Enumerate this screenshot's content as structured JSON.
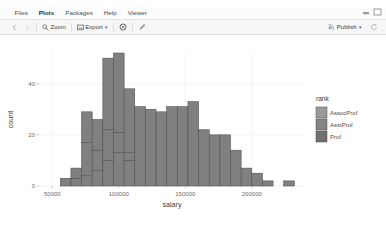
{
  "window": {
    "controls": [
      "minimize-icon",
      "maximize-icon"
    ]
  },
  "tabs": [
    {
      "label": "Files",
      "active": false,
      "name": "tab-files"
    },
    {
      "label": "Plots",
      "active": true,
      "name": "tab-plots"
    },
    {
      "label": "Packages",
      "active": false,
      "name": "tab-packages"
    },
    {
      "label": "Help",
      "active": false,
      "name": "tab-help"
    },
    {
      "label": "Viewer",
      "active": false,
      "name": "tab-viewer"
    }
  ],
  "toolbar": {
    "back_icon": "chevron-left-icon",
    "forward_icon": "chevron-right-icon",
    "zoom_label": "Zoom",
    "zoom_icon": "magnifier-icon",
    "export_label": "Export",
    "export_icon": "export-image-icon",
    "export_caret": "▾",
    "remove_icon": "remove-plot-icon",
    "clear_icon": "clear-all-plots-icon",
    "publish_label": "Publish",
    "publish_icon": "publish-icon",
    "publish_caret": "▾",
    "refresh_icon": "refresh-icon"
  },
  "chart_data": {
    "type": "bar",
    "subtype": "stacked-histogram",
    "title": "",
    "xlabel": "salary",
    "ylabel": "count",
    "xlim": [
      40000,
      240000
    ],
    "ylim": [
      0,
      52
    ],
    "xticks": [
      50000,
      100000,
      150000,
      200000
    ],
    "xtick_labels": [
      "50000",
      "100000",
      "150000",
      "200000"
    ],
    "yticks": [
      0,
      20,
      40
    ],
    "ytick_labels": [
      "0",
      "20",
      "40"
    ],
    "grid": true,
    "panel_background": "#ffffff",
    "bar_fill": "#808080",
    "bar_stroke": "#4d4d4d",
    "legend": {
      "title": "rank",
      "position": "right",
      "entries": [
        {
          "label": "AssocProf",
          "color": "#9a9a9a"
        },
        {
          "label": "AsstProf",
          "color": "#848484"
        },
        {
          "label": "Prof",
          "color": "#707070"
        }
      ]
    },
    "bin_width": 8000,
    "bin_starts": [
      56000,
      64000,
      72000,
      80000,
      88000,
      96000,
      104000,
      112000,
      120000,
      128000,
      136000,
      144000,
      152000,
      160000,
      168000,
      176000,
      184000,
      192000,
      200000,
      208000,
      216000,
      224000
    ],
    "series": [
      {
        "name": "AssocProf",
        "values": [
          0,
          0,
          4,
          6,
          10,
          13,
          10,
          0,
          0,
          0,
          0,
          0,
          0,
          0,
          0,
          0,
          0,
          0,
          0,
          0,
          0,
          0
        ]
      },
      {
        "name": "AsstProf",
        "values": [
          3,
          3,
          13,
          8,
          12,
          8,
          3,
          0,
          0,
          0,
          0,
          0,
          0,
          0,
          0,
          0,
          0,
          0,
          0,
          0,
          0,
          0
        ]
      },
      {
        "name": "Prof",
        "values": [
          0,
          4,
          12,
          12,
          28,
          31,
          25,
          31,
          30,
          29,
          31,
          31,
          33,
          22,
          20,
          20,
          14,
          7,
          5,
          2,
          0,
          2
        ]
      }
    ],
    "totals": [
      3,
      7,
      29,
      26,
      50,
      52,
      38,
      31,
      30,
      29,
      31,
      31,
      33,
      22,
      20,
      20,
      14,
      7,
      5,
      2,
      0,
      2
    ]
  }
}
